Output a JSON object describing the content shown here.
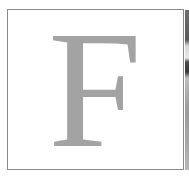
{
  "tile": {
    "letter": "F",
    "letter_color": "#a3a3a3",
    "border_color": "#8a8a8a",
    "background_color": "#ffffff"
  }
}
